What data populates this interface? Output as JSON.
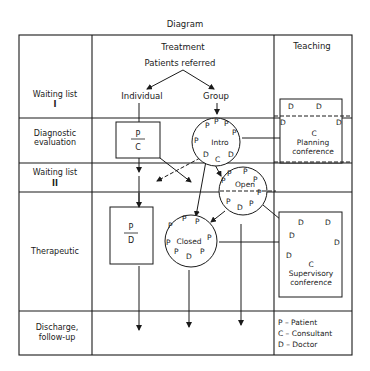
{
  "title": "Diagram",
  "columns": {
    "treatment": "Treatment",
    "teaching": "Teaching"
  },
  "rows": [
    {
      "label_line1": "Waiting list",
      "label_line2": "I"
    },
    {
      "label_line1": "Diagnostic",
      "label_line2": "evaluation"
    },
    {
      "label_line1": "Waiting list",
      "label_line2": "II"
    },
    {
      "label_line1": "Therapeutic",
      "label_line2": ""
    },
    {
      "label_line1": "Discharge,",
      "label_line2": "follow-up"
    }
  ],
  "flow": {
    "source": "Patients referred",
    "branch_individual": "Individual",
    "branch_group": "Group"
  },
  "boxes": {
    "diagnostic": {
      "top": "P",
      "bottom": "C"
    },
    "therapeutic": {
      "top": "P",
      "bottom": "D"
    }
  },
  "groups": {
    "intro": {
      "label": "Intro",
      "members": [
        "P",
        "P",
        "P",
        "P",
        "P",
        "P",
        "D",
        "C",
        "D"
      ]
    },
    "open": {
      "label": "Open",
      "members": [
        "P",
        "P",
        "P",
        "P",
        "P",
        "P",
        "D",
        "P"
      ]
    },
    "closed": {
      "label": "Closed",
      "members": [
        "P",
        "P",
        "P",
        "P",
        "P",
        "P",
        "D",
        "P",
        "P"
      ]
    }
  },
  "teaching": {
    "planning": {
      "line1": "Planning",
      "line2": "conference",
      "consultant": "C",
      "doctors": [
        "D",
        "D",
        "D",
        "D"
      ]
    },
    "supervisory": {
      "line1": "Supervisory",
      "line2": "conference",
      "consultant": "C",
      "doctors": [
        "D",
        "D",
        "D",
        "D",
        "D"
      ]
    }
  },
  "legend": [
    "P – Patient",
    "C – Consultant",
    "D – Doctor"
  ]
}
